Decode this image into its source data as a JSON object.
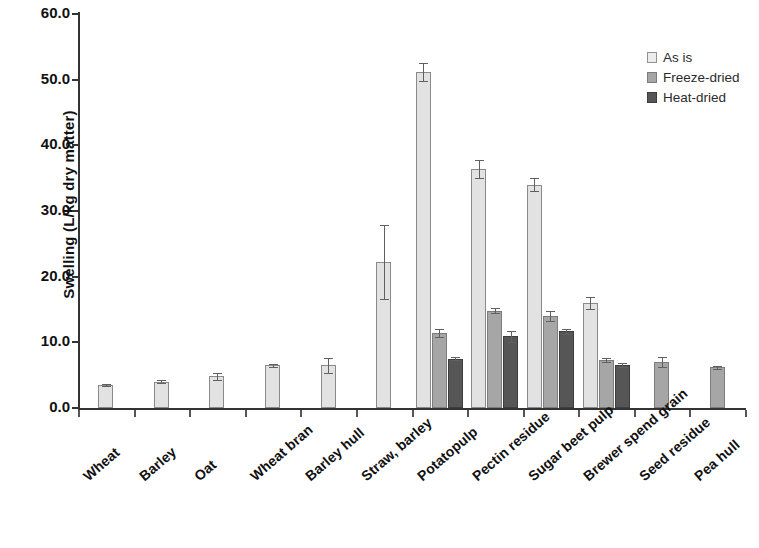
{
  "chart_data": {
    "type": "bar",
    "title": "",
    "xlabel": "",
    "ylabel": "Swelling (L/kg dry matter)",
    "ylim": [
      0,
      60
    ],
    "yticks": [
      "0.0",
      "10.0",
      "20.0",
      "30.0",
      "40.0",
      "50.0",
      "60.0"
    ],
    "grid": false,
    "legend_position": "top-right",
    "categories": [
      "Wheat",
      "Barley",
      "Oat",
      "Wheat bran",
      "Barley hull",
      "Straw, barley",
      "Potatopulp",
      "Pectin residue",
      "Sugar beet pulp",
      "Brewer spend grain",
      "Seed residue",
      "Pea hull"
    ],
    "series": [
      {
        "name": "As is",
        "color": "#e2e2e2",
        "values": [
          3.5,
          4.0,
          4.8,
          6.5,
          6.5,
          22.2,
          51.2,
          36.4,
          34.0,
          16.0,
          null,
          null
        ],
        "errors": [
          0.2,
          0.2,
          0.5,
          0.2,
          1.1,
          5.6,
          1.4,
          1.4,
          1.0,
          0.9,
          null,
          null
        ]
      },
      {
        "name": "Freeze-dried",
        "color": "#a6a6a6",
        "values": [
          null,
          null,
          null,
          null,
          null,
          null,
          11.4,
          14.8,
          14.0,
          7.3,
          7.0,
          6.2
        ],
        "errors": [
          null,
          null,
          null,
          null,
          null,
          null,
          0.6,
          0.4,
          0.8,
          0.3,
          0.8,
          0.2
        ]
      },
      {
        "name": "Heat-dried",
        "color": "#565656",
        "values": [
          null,
          null,
          null,
          null,
          null,
          null,
          7.5,
          10.9,
          11.7,
          6.5,
          null,
          null
        ],
        "errors": [
          null,
          null,
          null,
          null,
          null,
          null,
          0.2,
          0.8,
          0.4,
          0.3,
          null,
          null
        ]
      }
    ]
  },
  "legend": {
    "items": [
      {
        "label": "As is",
        "swatch": "asis"
      },
      {
        "label": "Freeze-dried",
        "swatch": "freeze"
      },
      {
        "label": "Heat-dried",
        "swatch": "heat"
      }
    ]
  }
}
